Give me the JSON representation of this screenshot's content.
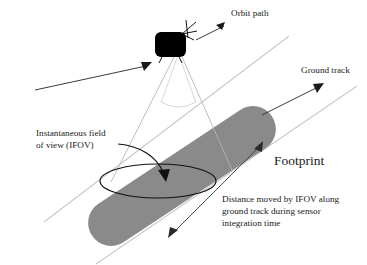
{
  "figure": {
    "background_color": "#ffffff",
    "footprint_color": "#8a8a8a",
    "rail_color": "#c9c9c9",
    "satellite_color": "#000000"
  },
  "labels": {
    "orbit_path": "Orbit path",
    "ground_track": "Ground track",
    "ifov_line1": "Instantaneous field",
    "ifov_line2": "of view (IFOV)",
    "footprint": "Footprint",
    "distance_line1": "Distance moved by IFOV along",
    "distance_line2": "ground track during sensor",
    "distance_line3": "integration time"
  },
  "icons": {
    "satellite": "satellite-icon",
    "antenna": "antenna-icon",
    "orbit_arrow": "orbit-path-arrow-icon",
    "approach_arrow": "approach-arrow-icon",
    "ground_track_arrow": "ground-track-arrow-icon",
    "footprint_arrow": "footprint-arrow-icon",
    "ifov_pointer": "ifov-curved-arrow-icon",
    "distance_arrow": "distance-double-arrow-icon"
  }
}
